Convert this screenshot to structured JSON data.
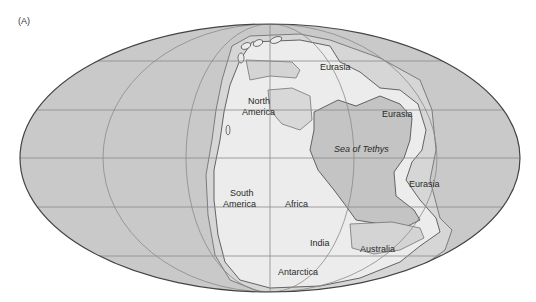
{
  "panel_label": "(A)",
  "map": {
    "projection": "Mollweide",
    "colors": {
      "ocean": "#c9c9c9",
      "shelf": "#d9d9d9",
      "land": "#ececec",
      "sea_tethys": "#c2c2c2",
      "outline": "#555555",
      "grid": "#8a8a8a"
    },
    "labels": {
      "eurasia_north": "Eurasia",
      "eurasia_east": "Eurasia",
      "eurasia_south": "Eurasia",
      "north_america": [
        "North",
        "America"
      ],
      "sea_of_tethys": "Sea of Tethys",
      "south_america": [
        "South",
        "America"
      ],
      "africa": "Africa",
      "india": "India",
      "australia": "Australia",
      "antarctica": "Antarctica"
    }
  }
}
